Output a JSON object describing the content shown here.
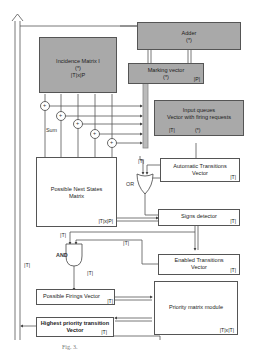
{
  "blocks": {
    "adder": {
      "title": "Adder",
      "sub": "(*)"
    },
    "incidence_matrix": {
      "title": "Incidence Matrix I",
      "sub": "(*)",
      "dim": "|T|x|P"
    },
    "marking_vector": {
      "title": "Marking vector",
      "sub": "(*)",
      "dim": "|P|"
    },
    "input_queues": {
      "title": "Input queues",
      "title2": "Vector with firing requests",
      "dim": "|T|",
      "sub": "(*)"
    },
    "possible_next_states": {
      "title": "Possible Next States",
      "title2": "Matrix",
      "dim": "|T|x|P|"
    },
    "automatic_transitions": {
      "title": "Automatic Transitions",
      "title2": "Vector",
      "dim": "|T|"
    },
    "signs_detector": {
      "title": "Signs detector",
      "dim": "|T|"
    },
    "enabled_transitions": {
      "title": "Enabled Transitions",
      "title2": "Vector",
      "dim": "|T|"
    },
    "possible_firings": {
      "title": "Possible Firings Vector",
      "dim": "|T|"
    },
    "priority_matrix": {
      "title": "Priority matrix module",
      "dim": "|T|x|T|"
    },
    "highest_priority": {
      "title": "Highest priority transition",
      "title2": "Vector",
      "dim": "|T|"
    }
  },
  "gates": {
    "or": "OR",
    "and": "AND"
  },
  "wire_labels": {
    "sum": "Sum",
    "t1": "|T|",
    "t2": "|T|",
    "t3": "|T|",
    "t4": "|T|",
    "t5": "|T|",
    "t6": "|T|"
  },
  "sum_symbol": "+",
  "caption": "Fig. 3."
}
